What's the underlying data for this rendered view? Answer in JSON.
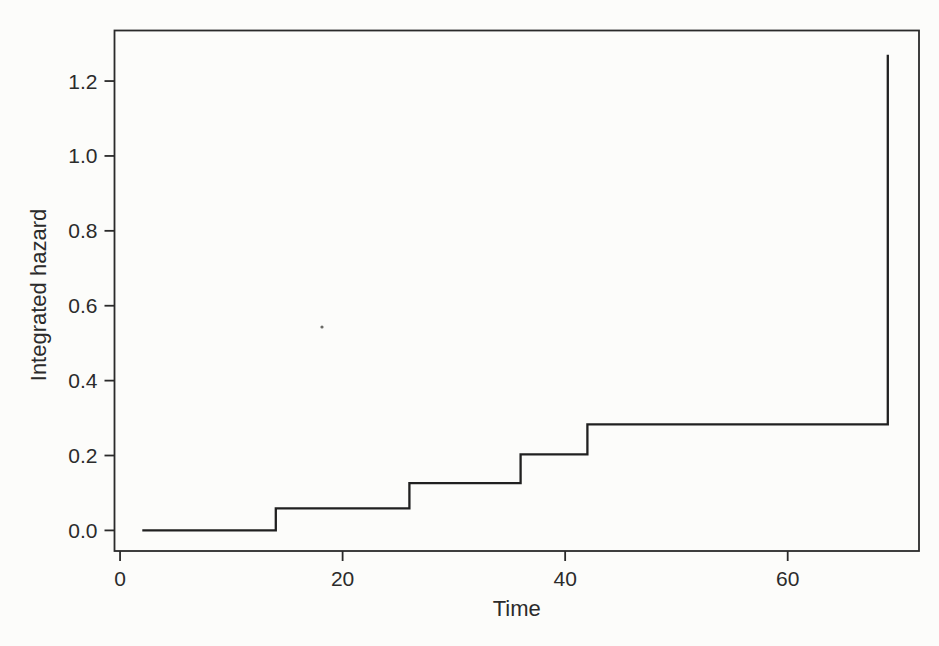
{
  "chart_data": {
    "type": "line",
    "style": "step-post",
    "title": "",
    "xlabel": "Time",
    "ylabel": "Integrated hazard",
    "xlim": [
      -0.5,
      71.8
    ],
    "ylim": [
      -0.055,
      1.335
    ],
    "grid": false,
    "legend": null,
    "x_ticks": [
      0,
      20,
      40,
      60
    ],
    "x_tick_labels": [
      "0",
      "20",
      "40",
      "60"
    ],
    "y_ticks": [
      0.0,
      0.2,
      0.4,
      0.6,
      0.8,
      1.0,
      1.2
    ],
    "y_tick_labels": [
      "0.0",
      "0.2",
      "0.4",
      "0.6",
      "0.8",
      "1.0",
      "1.2"
    ],
    "series": [
      {
        "step_points": [
          [
            2,
            0.0
          ],
          [
            14,
            0.0
          ],
          [
            14,
            0.059
          ],
          [
            26,
            0.059
          ],
          [
            26,
            0.126
          ],
          [
            36,
            0.126
          ],
          [
            36,
            0.203
          ],
          [
            42,
            0.203
          ],
          [
            42,
            0.283
          ],
          [
            69,
            0.283
          ],
          [
            69,
            1.27
          ]
        ],
        "jump_times": [
          14,
          26,
          36,
          42,
          69
        ],
        "levels_after_jump": [
          0.059,
          0.126,
          0.203,
          0.283,
          1.27
        ]
      }
    ],
    "colors": {
      "line": "#202020",
      "axis": "#2a2a2a",
      "text": "#2b2b2b",
      "background": "#fcfcfa"
    }
  }
}
